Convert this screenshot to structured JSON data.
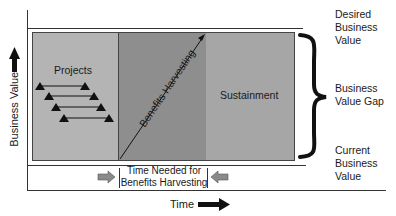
{
  "diagram": {
    "y_axis": {
      "label": "Business Value",
      "arrow": "up-arrow"
    },
    "x_axis": {
      "label": "Time",
      "arrow": "right-arrow"
    },
    "phases": [
      {
        "name": "Projects",
        "color": "#b4b4b4"
      },
      {
        "name": "Benefits Harvesting",
        "color": "#8e8e8e"
      },
      {
        "name": "Sustainment",
        "color": "#a6a6a6"
      }
    ],
    "project_bars_count": 4,
    "right_labels": {
      "desired": "Desired Business Value",
      "gap": "Business Value Gap",
      "current": "Current Business Value"
    },
    "time_needed_label_line1": "Time Needed for",
    "time_needed_label_line2": "Benefits Harvesting",
    "colors": {
      "line": "#2a2a2a",
      "brace": "#111111",
      "arrow_fill": "#8a8a8a"
    }
  }
}
